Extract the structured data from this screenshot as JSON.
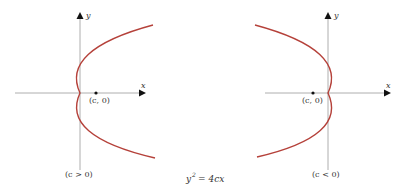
{
  "figure": {
    "equation": {
      "lhs": "y",
      "exp": "2",
      "rhs": "= 4cx"
    },
    "colors": {
      "curve": "#b5413a",
      "axis": "#888888",
      "arrow": "#111111",
      "text": "#333333"
    },
    "panels": [
      {
        "id": "left",
        "axis_x_label": "x",
        "axis_y_label": "y",
        "focus_label": "(c, 0)",
        "condition_label": "(c > 0)",
        "opens": "right"
      },
      {
        "id": "right",
        "axis_x_label": "x",
        "axis_y_label": "y",
        "focus_label": "(c, 0)",
        "condition_label": "(c < 0)",
        "opens": "left"
      }
    ]
  }
}
